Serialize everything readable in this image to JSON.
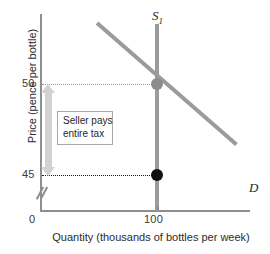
{
  "chart_data": {
    "type": "line",
    "title": "",
    "xlabel": "Quantity (thousands of bottles per week)",
    "ylabel": "Price (pence per bottle)",
    "xlim": [
      0,
      160
    ],
    "ylim": [
      40,
      60
    ],
    "grid": false,
    "legend_position": "inline-curve-labels",
    "x_ticks": [
      "0",
      "100"
    ],
    "y_ticks": [
      "50",
      "45"
    ],
    "y_axis_break": true,
    "series": [
      {
        "name": "S₁",
        "label": "S",
        "label_subscript": "1",
        "type": "vertical-supply",
        "color": "#9b9b9b",
        "x_value": 100,
        "points": [
          [
            100,
            40
          ],
          [
            100,
            60
          ]
        ]
      },
      {
        "name": "D",
        "label": "D",
        "type": "demand",
        "color": "#9b9b9b",
        "points": [
          [
            55,
            59
          ],
          [
            152,
            43.5
          ]
        ]
      }
    ],
    "points": [
      {
        "name": "equilibrium-point",
        "x": 100,
        "y": 50,
        "color": "#8d8d8d",
        "label": ""
      },
      {
        "name": "seller-net-price-point",
        "x": 100,
        "y": 45,
        "color": "#111111",
        "label": ""
      }
    ],
    "guides": [
      {
        "name": "price-50-guide",
        "y": 50,
        "style": "dotted",
        "color": "#9a9a9a"
      },
      {
        "name": "price-45-guide",
        "y": 45,
        "style": "dotted",
        "color": "#1a1a1a"
      }
    ],
    "annotations": [
      {
        "name": "tax-incidence-arrow",
        "type": "double-headed-arrow",
        "from_y": 50,
        "to_y": 45,
        "color": "#d2d2d2"
      },
      {
        "name": "tax-incidence-note",
        "type": "boxed-text",
        "line1": "Seller pays",
        "line2": "entire tax"
      }
    ]
  },
  "axes": {
    "y_title": "Price (pence per bottle)",
    "x_title": "Quantity (thousands of bottles per week)",
    "origin_label": "0",
    "y_tick_50": "50",
    "y_tick_45": "45",
    "x_tick_100": "100"
  },
  "curve_labels": {
    "supply": "S",
    "supply_sub": "1",
    "demand": "D"
  },
  "annotation": {
    "line1": "Seller pays",
    "line2": "entire tax"
  },
  "colors": {
    "curve": "#9b9b9b",
    "axis": "#8e8e8e",
    "arrow": "#d2d2d2",
    "equilibrium_dot": "#8d8d8d",
    "net_price_dot": "#111111",
    "guide_light": "#9a9a9a",
    "guide_dark": "#1a1a1a"
  }
}
